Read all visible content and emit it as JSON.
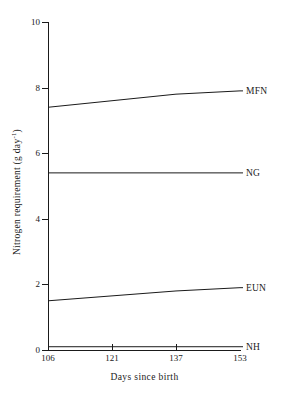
{
  "chart_data": {
    "type": "line",
    "title": "",
    "xlabel": "Days since birth",
    "ylabel": "Nitrogen requirement (g day",
    "ylabel_sup": "-1",
    "ylabel_suffix": ")",
    "x": [
      106,
      121,
      137,
      153
    ],
    "xtick_labels": [
      "106",
      "121",
      "137",
      "153"
    ],
    "ytick_labels": [
      "0",
      "2",
      "4",
      "6",
      "8",
      "10"
    ],
    "yticks": [
      0,
      2,
      4,
      6,
      8,
      10
    ],
    "ylim": [
      0,
      10
    ],
    "xlim": [
      106,
      153
    ],
    "grid": false,
    "legend_position": "right-inline",
    "line_color": "#1a1a1a",
    "background": "#ffffff",
    "series": [
      {
        "name": "MFN",
        "label": "MFN",
        "values": [
          7.4,
          7.6,
          7.8,
          7.9
        ]
      },
      {
        "name": "NG",
        "label": "NG",
        "values": [
          5.4,
          5.4,
          5.4,
          5.4
        ]
      },
      {
        "name": "EUN",
        "label": "EUN",
        "values": [
          1.5,
          1.65,
          1.8,
          1.9
        ]
      },
      {
        "name": "NH",
        "label": "NH",
        "values": [
          0.1,
          0.1,
          0.1,
          0.1
        ]
      }
    ]
  }
}
